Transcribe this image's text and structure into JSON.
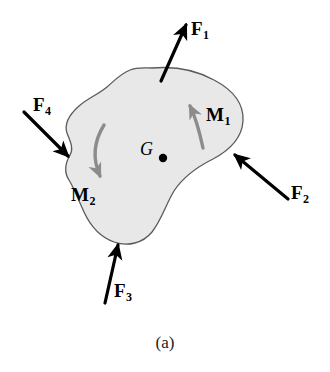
{
  "figure": {
    "caption": "(a)",
    "body_fill": "#e8e8e8",
    "body_stroke": "#5a5a5a",
    "force_color": "#000000",
    "moment_color": "#8c8c8c"
  },
  "center_of_mass": {
    "label": "G",
    "marker": "filled-dot"
  },
  "forces": [
    {
      "name": "F1",
      "symbol": "F",
      "subscript": "1",
      "direction": "up-right",
      "application": "top-edge"
    },
    {
      "name": "F2",
      "symbol": "F",
      "subscript": "2",
      "direction": "up-left",
      "application": "right-edge"
    },
    {
      "name": "F3",
      "symbol": "F",
      "subscript": "3",
      "direction": "up",
      "application": "bottom-edge"
    },
    {
      "name": "F4",
      "symbol": "F",
      "subscript": "4",
      "direction": "down-right",
      "application": "left-edge"
    }
  ],
  "moments": [
    {
      "name": "M1",
      "symbol": "M",
      "subscript": "1",
      "sense": "counterclockwise",
      "location": "right-lobe"
    },
    {
      "name": "M2",
      "symbol": "M",
      "subscript": "2",
      "sense": "clockwise",
      "location": "left-side"
    }
  ]
}
